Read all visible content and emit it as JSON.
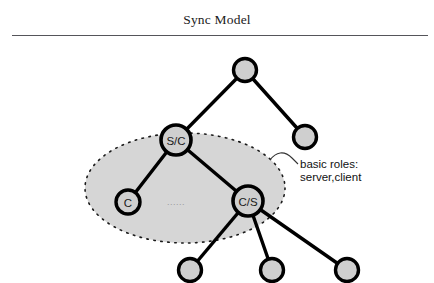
{
  "header": {
    "title": "Sync Model"
  },
  "colors": {
    "node_fill": "#cfcfcf",
    "node_stroke": "#000000",
    "edge": "#000000",
    "region_fill": "#d6d6d6",
    "region_border": "#1a1a1a",
    "text": "#111111",
    "rule": "#55555a",
    "background": "#ffffff"
  },
  "diagram": {
    "type": "tree",
    "region": {
      "name": "basic-roles-region",
      "shape": "ellipse",
      "border_style": "dotted",
      "cx": 185,
      "cy": 188,
      "rx": 100,
      "ry": 55
    },
    "annotation": {
      "line1": "basic roles:",
      "line2": "server,client",
      "x": 300,
      "y1": 168,
      "y2": 181
    },
    "ellipsis": {
      "label": "......",
      "x": 176,
      "y": 202
    },
    "nodes": [
      {
        "id": "root",
        "label": "",
        "cx": 245,
        "cy": 70,
        "r": 11.5
      },
      {
        "id": "right1",
        "label": "",
        "cx": 305,
        "cy": 137,
        "r": 11.5
      },
      {
        "id": "sc",
        "label": "S/C",
        "cx": 176,
        "cy": 140,
        "r": 15
      },
      {
        "id": "c",
        "label": "C",
        "cx": 128,
        "cy": 202,
        "r": 12
      },
      {
        "id": "cs",
        "label": "C/S",
        "cx": 248,
        "cy": 201,
        "r": 15
      },
      {
        "id": "leaf1",
        "label": "",
        "cx": 190,
        "cy": 270,
        "r": 11.5
      },
      {
        "id": "leaf2",
        "label": "",
        "cx": 272,
        "cy": 270,
        "r": 11.5
      },
      {
        "id": "leaf3",
        "label": "",
        "cx": 347,
        "cy": 270,
        "r": 11.5
      }
    ],
    "edges": [
      {
        "from": "root",
        "to": "sc"
      },
      {
        "from": "root",
        "to": "right1"
      },
      {
        "from": "sc",
        "to": "c"
      },
      {
        "from": "sc",
        "to": "cs"
      },
      {
        "from": "cs",
        "to": "leaf1"
      },
      {
        "from": "cs",
        "to": "leaf2"
      },
      {
        "from": "cs",
        "to": "leaf3"
      }
    ]
  }
}
